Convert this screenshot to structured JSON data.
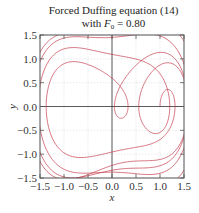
{
  "chart_data": {
    "type": "line",
    "title": "Forced Duffing equation (14)",
    "subtitle_prefix": "with ",
    "subtitle_var": "F",
    "subtitle_sub": "0",
    "subtitle_suffix": " = 0.80",
    "xlabel": "x",
    "ylabel": "y",
    "xlim": [
      -1.5,
      1.5
    ],
    "ylim": [
      -1.5,
      1.5
    ],
    "xticks": [
      -1.5,
      -1.0,
      -0.5,
      0.0,
      0.5,
      1.0,
      1.5
    ],
    "yticks": [
      -1.5,
      -1.0,
      -0.5,
      0.0,
      0.5,
      1.0,
      1.5
    ],
    "xtick_labels": [
      "−1.5",
      "−1.0",
      "−0.5",
      "0.0",
      "0.5",
      "1.0",
      "1.5"
    ],
    "ytick_labels": [
      "−1.5",
      "−1.0",
      "−0.5",
      "0.0",
      "0.5",
      "1.0",
      "1.5"
    ],
    "grid": true,
    "zero_lines": true,
    "legend": null,
    "series": [
      {
        "name": "phase trajectory",
        "color": "#c0283a",
        "description": "Chaotic phase-space trajectory (x vs y=dx/dt) of forced Duffing oscillator, two-lobed attractor",
        "approx_extent": {
          "x": [
            -1.35,
            1.35
          ],
          "y": [
            -0.85,
            0.75
          ]
        },
        "params": {
          "F0": 0.8,
          "delta": 0.3,
          "omega": 1.2,
          "x0": 1.0,
          "y0": 0.0,
          "t_end": 200,
          "dt": 0.01
        }
      }
    ]
  },
  "colors": {
    "curve": "#c0283a",
    "grid": "#dcdcdc",
    "axis": "#555555",
    "zero": "#333333"
  }
}
